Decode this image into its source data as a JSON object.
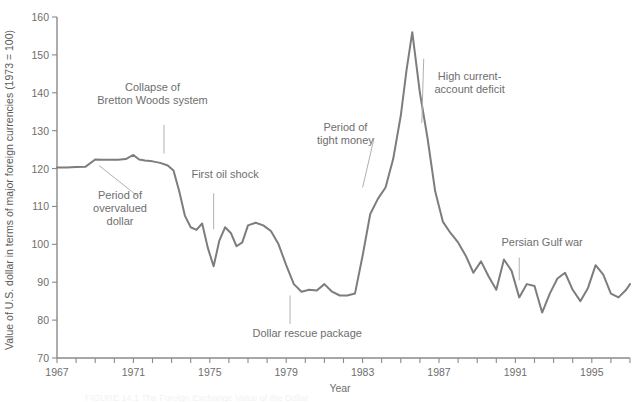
{
  "chart_data": {
    "type": "line",
    "title": "",
    "xlabel": "Year",
    "ylabel": "Value of U.S. dollar in terms of major foreign currencies (1973 = 100)",
    "xlim": [
      1967,
      1997
    ],
    "ylim": [
      70,
      160
    ],
    "ytick_values": [
      70,
      80,
      90,
      100,
      110,
      120,
      130,
      140,
      150,
      160
    ],
    "xtick_values": [
      1967,
      1968,
      1969,
      1970,
      1971,
      1972,
      1973,
      1974,
      1975,
      1976,
      1977,
      1978,
      1979,
      1980,
      1981,
      1982,
      1983,
      1984,
      1985,
      1986,
      1987,
      1988,
      1989,
      1990,
      1991,
      1992,
      1993,
      1994,
      1995,
      1996,
      1997
    ],
    "xtick_labels_shown": [
      "1967",
      "1971",
      "1975",
      "1979",
      "1983",
      "1987",
      "1991",
      "1995"
    ],
    "grid": false,
    "legend": "none",
    "series": [
      {
        "name": "U.S. dollar index",
        "color": "#7d7d7d",
        "x": [
          1967.0,
          1967.5,
          1968.0,
          1968.5,
          1969.0,
          1969.4,
          1969.8,
          1970.2,
          1970.6,
          1971.0,
          1971.3,
          1971.6,
          1972.0,
          1972.4,
          1972.8,
          1973.1,
          1973.4,
          1973.7,
          1974.0,
          1974.3,
          1974.6,
          1974.9,
          1975.2,
          1975.5,
          1975.8,
          1976.1,
          1976.4,
          1976.7,
          1977.0,
          1977.4,
          1977.8,
          1978.2,
          1978.6,
          1979.0,
          1979.4,
          1979.8,
          1980.2,
          1980.6,
          1981.0,
          1981.4,
          1981.8,
          1982.2,
          1982.6,
          1983.0,
          1983.4,
          1983.8,
          1984.2,
          1984.6,
          1985.0,
          1985.3,
          1985.6,
          1986.0,
          1986.4,
          1986.8,
          1987.2,
          1987.6,
          1988.0,
          1988.4,
          1988.8,
          1989.2,
          1989.6,
          1990.0,
          1990.4,
          1990.8,
          1991.2,
          1991.6,
          1992.0,
          1992.4,
          1992.8,
          1993.2,
          1993.6,
          1994.0,
          1994.4,
          1994.8,
          1995.2,
          1995.6,
          1996.0,
          1996.4,
          1996.8,
          1997.0
        ],
        "y": [
          120.3,
          120.3,
          120.4,
          120.5,
          122.4,
          122.3,
          122.3,
          122.3,
          122.5,
          123.6,
          122.4,
          122.1,
          121.9,
          121.5,
          120.8,
          119.5,
          114.0,
          107.5,
          104.5,
          103.8,
          105.5,
          99.0,
          94.2,
          101.0,
          104.5,
          103.0,
          99.5,
          100.5,
          105.0,
          105.7,
          105.0,
          103.5,
          100.0,
          94.5,
          89.5,
          87.5,
          88.0,
          87.8,
          89.5,
          87.5,
          86.5,
          86.5,
          87.0,
          97.0,
          108.0,
          112.0,
          115.0,
          122.5,
          134.0,
          146.0,
          156.0,
          140.0,
          128.0,
          114.0,
          106.0,
          103.0,
          100.5,
          97.0,
          92.5,
          95.5,
          91.5,
          88.0,
          96.0,
          93.0,
          86.0,
          89.5,
          89.0,
          82.0,
          87.0,
          91.0,
          92.5,
          88.0,
          85.0,
          88.5,
          94.5,
          92.0,
          87.0,
          86.0,
          88.0,
          89.5
        ]
      }
    ],
    "annotations": [
      {
        "name": "collapse-bretton-woods",
        "lines": [
          "Collapse of",
          "Bretton Woods system"
        ],
        "text_x": 1972.0,
        "text_y": 140.5,
        "leader_from": [
          1972.6,
          131.5
        ],
        "leader_to": [
          1972.6,
          124.0
        ]
      },
      {
        "name": "period-overvalued-dollar",
        "lines": [
          "Period of",
          "overvalued",
          "dollar"
        ],
        "text_x": 1970.3,
        "text_y": 112.0,
        "leader_from": [
          1971.2,
          112.8
        ],
        "leader_to": [
          1969.2,
          120.8
        ]
      },
      {
        "name": "first-oil-shock",
        "lines": [
          "First oil shock"
        ],
        "text_x": 1975.8,
        "text_y": 117.5,
        "leader_from": [
          1975.2,
          113.5
        ],
        "leader_to": [
          1975.2,
          104.0
        ]
      },
      {
        "name": "period-tight-money",
        "lines": [
          "Period of",
          "tight money"
        ],
        "text_x": 1982.1,
        "text_y": 130.0,
        "leader_from": [
          1983.6,
          128.0
        ],
        "leader_to": [
          1983.0,
          115.0
        ]
      },
      {
        "name": "high-current-account-deficit",
        "lines": [
          "High current-",
          "account deficit"
        ],
        "text_x": 1988.6,
        "text_y": 143.5,
        "leader_from": [
          1986.2,
          149.0
        ],
        "leader_to": [
          1986.1,
          132.0
        ]
      },
      {
        "name": "dollar-rescue-package",
        "lines": [
          "Dollar rescue package"
        ],
        "text_x": 1980.1,
        "text_y": 75.5,
        "leader_from": [
          1979.2,
          79.0
        ],
        "leader_to": [
          1979.2,
          86.5
        ]
      },
      {
        "name": "persian-gulf-war",
        "lines": [
          "Persian Gulf war"
        ],
        "text_x": 1992.4,
        "text_y": 99.5,
        "leader_from": [
          1991.2,
          96.5
        ],
        "leader_to": [
          1991.2,
          90.5
        ]
      }
    ],
    "caption": "FIGURE 14.1  The Foreign Exchange Value of the Dollar"
  }
}
